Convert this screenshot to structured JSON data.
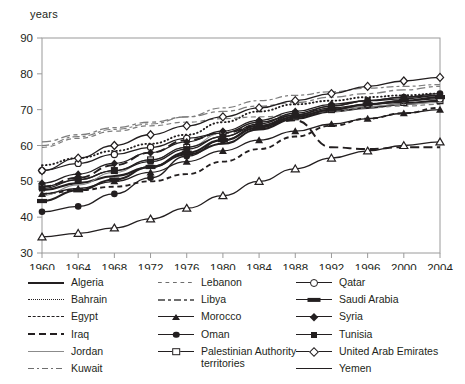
{
  "chart_data": {
    "type": "line",
    "title": "",
    "xlabel": "",
    "ylabel": "years",
    "xlim": [
      1960,
      2004
    ],
    "ylim": [
      30,
      90
    ],
    "yticks": [
      30,
      40,
      50,
      60,
      70,
      80,
      90
    ],
    "xticks": [
      1960,
      1964,
      1968,
      1972,
      1976,
      1980,
      1984,
      1988,
      1992,
      1996,
      2000,
      2004
    ],
    "grid": false,
    "legend_position": "below",
    "x": [
      1960,
      1964,
      1968,
      1972,
      1976,
      1980,
      1984,
      1988,
      1992,
      1996,
      2000,
      2004
    ],
    "series": [
      {
        "name": "Algeria",
        "style": "solid-thick",
        "marker": "none",
        "values": [
          47.5,
          49.5,
          51.5,
          54.0,
          57.5,
          60.5,
          64.5,
          67.5,
          69.5,
          70.5,
          71.5,
          72.5
        ]
      },
      {
        "name": "Bahrain",
        "style": "dotted",
        "marker": "none",
        "values": [
          54.5,
          56.5,
          58.5,
          60.5,
          63.0,
          66.5,
          69.5,
          71.5,
          72.5,
          73.5,
          74.0,
          74.5
        ]
      },
      {
        "name": "Egypt",
        "style": "dashed",
        "marker": "none",
        "values": [
          46.5,
          47.5,
          48.5,
          50.0,
          52.0,
          55.5,
          59.0,
          62.5,
          65.5,
          67.5,
          69.0,
          70.5
        ]
      },
      {
        "name": "Iraq",
        "style": "long-dash",
        "marker": "none",
        "values": [
          48.5,
          51.0,
          54.5,
          58.0,
          61.5,
          63.5,
          65.5,
          67.0,
          59.5,
          59.0,
          59.5,
          59.5
        ]
      },
      {
        "name": "Jordan",
        "style": "thin-solid",
        "marker": "none",
        "values": [
          46.0,
          49.0,
          52.5,
          56.0,
          59.5,
          63.5,
          66.5,
          68.5,
          70.0,
          71.0,
          71.5,
          72.0
        ]
      },
      {
        "name": "Kuwait",
        "style": "dash-dot",
        "marker": "none",
        "values": [
          60.0,
          62.5,
          64.5,
          66.0,
          68.0,
          70.5,
          72.5,
          74.0,
          75.0,
          76.0,
          76.5,
          77.0
        ]
      },
      {
        "name": "Lebanon",
        "style": "dash-thin",
        "marker": "none",
        "values": [
          59.5,
          62.0,
          64.0,
          65.5,
          66.5,
          67.5,
          68.0,
          68.5,
          69.5,
          70.5,
          71.0,
          71.5
        ]
      },
      {
        "name": "Libya",
        "style": "dash-dot-2",
        "marker": "none",
        "values": [
          61.0,
          63.0,
          65.0,
          66.5,
          68.0,
          69.5,
          71.0,
          72.0,
          73.5,
          74.5,
          75.5,
          76.5
        ]
      },
      {
        "name": "Morocco",
        "style": "solid",
        "marker": "filled-triangle",
        "values": [
          46.5,
          48.0,
          50.0,
          52.5,
          55.5,
          58.5,
          61.5,
          64.0,
          66.0,
          67.5,
          69.0,
          70.0
        ]
      },
      {
        "name": "Oman",
        "style": "solid",
        "marker": "filled-circle",
        "values": [
          41.5,
          43.0,
          46.5,
          51.0,
          57.0,
          61.5,
          65.5,
          68.5,
          71.0,
          72.5,
          73.5,
          74.5
        ]
      },
      {
        "name": "Palestinian Authority territories",
        "style": "solid",
        "marker": "open-square",
        "values": [
          48.5,
          50.5,
          53.0,
          56.0,
          59.5,
          62.5,
          65.5,
          68.0,
          70.0,
          71.5,
          72.0,
          72.5
        ]
      },
      {
        "name": "Qatar",
        "style": "solid",
        "marker": "open-circle",
        "values": [
          53.0,
          55.0,
          57.5,
          59.5,
          62.0,
          63.5,
          66.5,
          68.5,
          70.5,
          71.5,
          72.5,
          73.0
        ]
      },
      {
        "name": "Saudi Arabia",
        "style": "solid-thick",
        "marker": "bar",
        "values": [
          44.5,
          47.5,
          50.5,
          54.0,
          58.0,
          61.5,
          65.0,
          68.0,
          70.0,
          71.5,
          72.5,
          73.5
        ]
      },
      {
        "name": "Syria",
        "style": "solid",
        "marker": "filled-diamond",
        "values": [
          49.5,
          52.0,
          55.0,
          58.0,
          61.0,
          64.0,
          67.0,
          69.5,
          71.5,
          72.5,
          73.5,
          74.0
        ]
      },
      {
        "name": "Tunisia",
        "style": "solid",
        "marker": "filled-square",
        "values": [
          48.0,
          50.5,
          53.0,
          55.5,
          59.0,
          62.5,
          66.0,
          69.0,
          71.0,
          72.5,
          73.0,
          74.0
        ]
      },
      {
        "name": "United Arab Emirates",
        "style": "solid",
        "marker": "open-diamond",
        "values": [
          53.0,
          56.5,
          60.0,
          63.0,
          65.5,
          68.0,
          70.5,
          72.5,
          74.5,
          76.5,
          78.0,
          79.0
        ]
      },
      {
        "name": "Yemen",
        "style": "solid",
        "marker": "open-triangle",
        "values": [
          34.5,
          35.5,
          37.0,
          39.5,
          42.5,
          46.0,
          50.0,
          53.5,
          56.5,
          58.5,
          60.0,
          61.0
        ]
      }
    ]
  },
  "legend": {
    "columns": [
      {
        "items": [
          {
            "label": "Algeria",
            "sample": "solid-thick"
          },
          {
            "label": "Bahrain",
            "sample": "dotted"
          },
          {
            "label": "Egypt",
            "sample": "dashed"
          },
          {
            "label": "Iraq",
            "sample": "long-dash"
          },
          {
            "label": "Jordan",
            "sample": "thin-solid"
          },
          {
            "label": "Kuwait",
            "sample": "dash-dot"
          }
        ]
      },
      {
        "items": [
          {
            "label": "Lebanon",
            "sample": "dash-thin"
          },
          {
            "label": "Libya",
            "sample": "dash-dot-2"
          },
          {
            "label": "Morocco",
            "sample": "marker-filled-triangle"
          },
          {
            "label": "Oman",
            "sample": "marker-filled-circle"
          },
          {
            "label": "Palestinian Authority territories",
            "sample": "marker-open-square"
          }
        ]
      },
      {
        "items": [
          {
            "label": "Qatar",
            "sample": "marker-open-circle"
          },
          {
            "label": "Saudi Arabia",
            "sample": "marker-bar"
          },
          {
            "label": "Syria",
            "sample": "marker-filled-diamond"
          },
          {
            "label": "Tunisia",
            "sample": "marker-filled-square"
          },
          {
            "label": "United Arab Emirates",
            "sample": "marker-open-diamond"
          },
          {
            "label": "Yemen",
            "sample": "marker-open-triangle"
          }
        ]
      }
    ]
  },
  "colors": {
    "ink": "#231f20",
    "grey": "#8b8b8b",
    "frame": "#9a9a9a",
    "background": "#ffffff"
  }
}
